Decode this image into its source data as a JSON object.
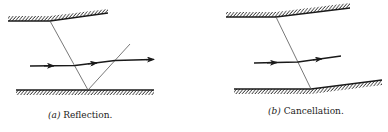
{
  "figure": {
    "panels": [
      {
        "id": "a",
        "label": "(a)",
        "title": "Reflection."
      },
      {
        "id": "b",
        "label": "(b)",
        "title": "Cancellation."
      }
    ],
    "colors": {
      "ink": "#1a1a1a",
      "thin_line": "#555555",
      "background": "#ffffff"
    }
  }
}
